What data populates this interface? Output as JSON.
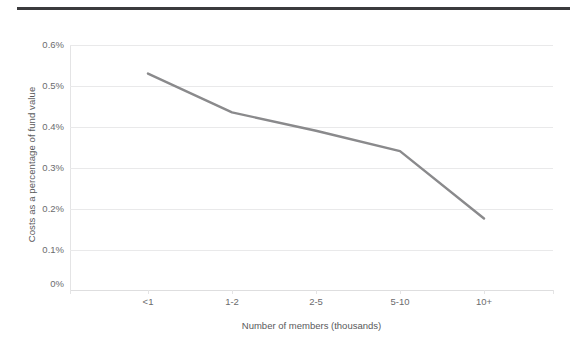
{
  "chart_data": {
    "type": "line",
    "title": "",
    "subtitle": "",
    "categories": [
      "<1",
      "1-2",
      "2-5",
      "5-10",
      "10+"
    ],
    "series": [
      {
        "name": "Costs as a percentage of fund value",
        "values": [
          0.53,
          0.435,
          0.39,
          0.34,
          0.175
        ],
        "color": "#8a8a8c"
      }
    ],
    "xlabel": "Number of members (thousands)",
    "ylabel": "Costs as a percentage of fund value",
    "ylim": [
      0,
      0.6
    ],
    "ytick_labels": [
      "0.6%",
      "0.5%",
      "0.4%",
      "0.3%",
      "0.2%",
      "0.1%",
      "0%"
    ],
    "ytick_values": [
      0.6,
      0.5,
      0.4,
      0.3,
      0.2,
      0.1,
      0
    ],
    "grid": true,
    "grid_color": "#e9e9ea",
    "legend": "none",
    "legend_position": "none",
    "value_unit": "%"
  },
  "decoration": {
    "top_rule_color": "#3b3b3d"
  }
}
